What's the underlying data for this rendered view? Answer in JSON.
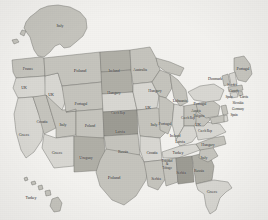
{
  "map": {
    "title": "United States state map with country labels",
    "projection": "albers-usa",
    "background_color": "#f3f2ef",
    "border_color": "#6f6f6b",
    "fill_light": "#d8d7d2",
    "fill_mid": "#c5c4bd",
    "fill_dark": "#b0afa7",
    "fill_darker": "#9d9c94",
    "label_color": "#2b2b2b"
  },
  "insets": [
    {
      "name": "alaska-inset",
      "label": "Italy"
    },
    {
      "name": "hawaii-inset",
      "label": "Turkey"
    }
  ],
  "states": [
    {
      "code": "AK",
      "name": "Alaska",
      "label": "Italy",
      "x": 60,
      "y": 25,
      "size": "sm",
      "shade": "fill_mid"
    },
    {
      "code": "HI",
      "name": "Hawaii",
      "label": "Turkey",
      "x": 31,
      "y": 197,
      "size": "sm",
      "shade": "fill_mid"
    },
    {
      "code": "WA",
      "name": "Washington",
      "label": "France",
      "x": 28,
      "y": 68,
      "size": "sm",
      "shade": "fill_mid"
    },
    {
      "code": "OR",
      "name": "Oregon",
      "label": "UK",
      "x": 24,
      "y": 87,
      "size": "sm",
      "shade": "fill_light"
    },
    {
      "code": "ID",
      "name": "Idaho",
      "label": "UK",
      "x": 51,
      "y": 94,
      "size": "sm",
      "shade": "fill_light"
    },
    {
      "code": "MT",
      "name": "Montana",
      "label": "Poland",
      "x": 80,
      "y": 70,
      "size": "md",
      "shade": "fill_mid"
    },
    {
      "code": "ND",
      "name": "North Dakota",
      "label": "Iceland",
      "x": 114,
      "y": 70,
      "size": "sm",
      "shade": "fill_dark"
    },
    {
      "code": "MN",
      "name": "Minnesota",
      "label": "Australia",
      "x": 140,
      "y": 69,
      "size": "sm",
      "shade": "fill_mid"
    },
    {
      "code": "SD",
      "name": "South Dakota",
      "label": "Hungary",
      "x": 114,
      "y": 92,
      "size": "sm",
      "shade": "fill_dark"
    },
    {
      "code": "WI",
      "name": "Wisconsin",
      "label": "Hungary",
      "x": 155,
      "y": 90,
      "size": "sm",
      "shade": "fill_mid"
    },
    {
      "code": "MI",
      "name": "Michigan",
      "label": "Lithuania",
      "x": 180,
      "y": 100,
      "size": "sm",
      "shade": "fill_mid"
    },
    {
      "code": "CA",
      "name": "California",
      "label": "Greece",
      "x": 24,
      "y": 134,
      "size": "sm",
      "shade": "fill_light"
    },
    {
      "code": "NV",
      "name": "Nevada",
      "label": "Croatia",
      "x": 42,
      "y": 121,
      "size": "sm",
      "shade": "fill_mid"
    },
    {
      "code": "UT",
      "name": "Utah",
      "label": "Italy",
      "x": 63,
      "y": 124,
      "size": "sm",
      "shade": "fill_mid"
    },
    {
      "code": "AZ",
      "name": "Arizona",
      "label": "Greece",
      "x": 57,
      "y": 152,
      "size": "sm",
      "shade": "fill_light"
    },
    {
      "code": "WY",
      "name": "Wyoming",
      "label": "Portugal",
      "x": 81,
      "y": 103,
      "size": "sm",
      "shade": "fill_mid"
    },
    {
      "code": "CO",
      "name": "Colorado",
      "label": "Poland",
      "x": 90,
      "y": 125,
      "size": "sm",
      "shade": "fill_mid"
    },
    {
      "code": "NM",
      "name": "New Mexico",
      "label": "Uruguay",
      "x": 86,
      "y": 157,
      "size": "sm",
      "shade": "fill_dark"
    },
    {
      "code": "NE",
      "name": "Nebraska",
      "label": "Czech Rep",
      "x": 118,
      "y": 113,
      "size": "xs",
      "shade": "fill_light"
    },
    {
      "code": "KS",
      "name": "Kansas",
      "label": "Latvia",
      "x": 120,
      "y": 131,
      "size": "sm",
      "shade": "fill_darker"
    },
    {
      "code": "OK",
      "name": "Oklahoma",
      "label": "Russia",
      "x": 123,
      "y": 151,
      "size": "sm",
      "shade": "fill_mid"
    },
    {
      "code": "TX",
      "name": "Texas",
      "label": "Poland",
      "x": 114,
      "y": 177,
      "size": "md",
      "shade": "fill_mid"
    },
    {
      "code": "IA",
      "name": "Iowa",
      "label": "UK",
      "x": 148,
      "y": 107,
      "size": "sm",
      "shade": "fill_light"
    },
    {
      "code": "MO",
      "name": "Missouri",
      "label": "Italy",
      "x": 154,
      "y": 124,
      "size": "sm",
      "shade": "fill_mid"
    },
    {
      "code": "AR",
      "name": "Arkansas",
      "label": "Croatia",
      "x": 152,
      "y": 152,
      "size": "sm",
      "shade": "fill_light"
    },
    {
      "code": "LA",
      "name": "Louisiana",
      "label": "Serbia",
      "x": 156,
      "y": 178,
      "size": "sm",
      "shade": "fill_mid"
    },
    {
      "code": "IL",
      "name": "Illinois",
      "label": "Portugal",
      "x": 165,
      "y": 123,
      "size": "sm",
      "shade": "fill_mid"
    },
    {
      "code": "IN",
      "name": "Indiana",
      "label": "Ireland",
      "x": 175,
      "y": 135,
      "size": "sm",
      "shade": "fill_light"
    },
    {
      "code": "OH",
      "name": "Ohio",
      "label": "Czech Rep",
      "x": 188,
      "y": 118,
      "size": "xs",
      "shade": "fill_mid"
    },
    {
      "code": "KY",
      "name": "Kentucky",
      "label": "Latvia",
      "x": 180,
      "y": 141,
      "size": "sm",
      "shade": "fill_light"
    },
    {
      "code": "TN",
      "name": "Tennessee",
      "label": "Turkey",
      "x": 178,
      "y": 152,
      "size": "sm",
      "shade": "fill_light"
    },
    {
      "code": "MS",
      "name": "Mississippi",
      "label": "Trinidad & Tobago",
      "x": 167,
      "y": 165,
      "size": "xs",
      "shade": "fill_mid",
      "multiline": true
    },
    {
      "code": "AL",
      "name": "Alabama",
      "label": "Serbia",
      "x": 181,
      "y": 172,
      "size": "sm",
      "shade": "fill_darker"
    },
    {
      "code": "GA",
      "name": "Georgia",
      "label": "Russia",
      "x": 199,
      "y": 170,
      "size": "sm",
      "shade": "fill_dark"
    },
    {
      "code": "FL",
      "name": "Florida",
      "label": "Greece",
      "x": 212,
      "y": 191,
      "size": "sm",
      "shade": "fill_light"
    },
    {
      "code": "SC",
      "name": "South Carolina",
      "label": "Italy",
      "x": 204,
      "y": 157,
      "size": "sm",
      "shade": "fill_mid"
    },
    {
      "code": "NC",
      "name": "North Carolina",
      "label": "Hungary",
      "x": 208,
      "y": 144,
      "size": "sm",
      "shade": "fill_mid"
    },
    {
      "code": "VA",
      "name": "Virginia",
      "label": "Czech Rep",
      "x": 205,
      "y": 131,
      "size": "xs",
      "shade": "fill_light"
    },
    {
      "code": "WV",
      "name": "West Virginia",
      "label": "UK",
      "x": 198,
      "y": 124,
      "size": "sm",
      "shade": "fill_mid"
    },
    {
      "code": "PA",
      "name": "Pennsylvania",
      "label": "Bulgaria",
      "x": 199,
      "y": 116,
      "size": "xs",
      "shade": "fill_mid"
    },
    {
      "code": "NY",
      "name": "New York",
      "label": "Portugal",
      "x": 200,
      "y": 103,
      "size": "sm",
      "shade": "fill_light"
    },
    {
      "code": "ME",
      "name": "Maine",
      "label": "Portugal",
      "x": 243,
      "y": 68,
      "size": "sm",
      "shade": "fill_mid"
    },
    {
      "code": "VT",
      "name": "Vermont",
      "label": "Denmark",
      "x": 215,
      "y": 78,
      "size": "sm",
      "shade": "fill_mid"
    },
    {
      "code": "NH",
      "name": "New Hampshire",
      "label": "Sweden",
      "x": 232,
      "y": 85,
      "size": "xs",
      "shade": "fill_light"
    },
    {
      "code": "MA",
      "name": "Massachusetts",
      "label": "Canada",
      "x": 234,
      "y": 91,
      "size": "xs",
      "shade": "fill_mid"
    },
    {
      "code": "RI",
      "name": "Rhode Island",
      "label": "Spain",
      "x": 229,
      "y": 97,
      "size": "xs",
      "shade": "fill_mid"
    },
    {
      "code": "CT",
      "name": "Connecticut",
      "label": "Latvia",
      "x": 244,
      "y": 97,
      "size": "xs",
      "shade": "fill_light"
    },
    {
      "code": "NJ",
      "name": "New Jersey",
      "label": "Slovakia",
      "x": 238,
      "y": 103,
      "size": "xs",
      "shade": "fill_mid"
    },
    {
      "code": "DE",
      "name": "Delaware",
      "label": "Germany",
      "x": 238,
      "y": 109,
      "size": "xs",
      "shade": "fill_light"
    },
    {
      "code": "MD",
      "name": "Maryland",
      "label": "Spain",
      "x": 234,
      "y": 115,
      "size": "xs",
      "shade": "fill_mid"
    },
    {
      "code": "AUS",
      "name": "Austria-region",
      "label": "Austria",
      "x": 196,
      "y": 111,
      "size": "xs",
      "shade": "fill_mid"
    }
  ]
}
